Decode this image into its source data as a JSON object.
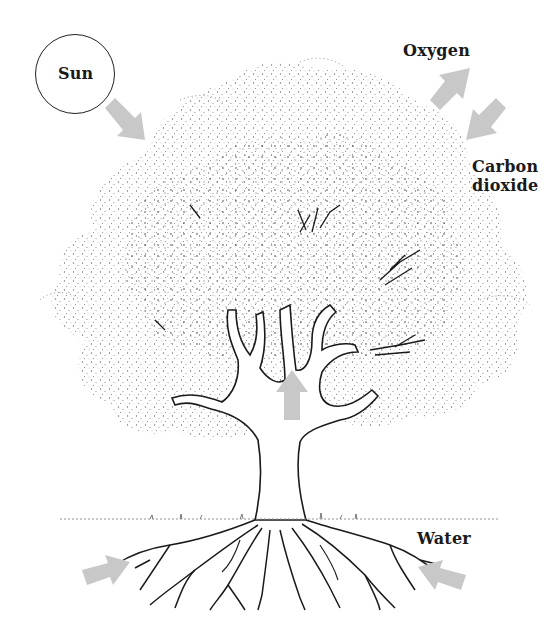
{
  "diagram": {
    "labels": {
      "sun": "Sun",
      "oxygen": "Oxygen",
      "carbon_dioxide_line1": "Carbon",
      "carbon_dioxide_line2": "dioxide",
      "water": "Water"
    },
    "arrows": [
      {
        "id": "sunlight",
        "direction": "down-right",
        "from": "Sun",
        "to": "canopy"
      },
      {
        "id": "oxygen-out",
        "direction": "up-right",
        "from": "canopy",
        "to": "Oxygen"
      },
      {
        "id": "co2-in",
        "direction": "down-left",
        "from": "Carbon dioxide",
        "to": "canopy"
      },
      {
        "id": "sap-up",
        "direction": "up",
        "from": "trunk",
        "to": "canopy"
      },
      {
        "id": "water-left",
        "direction": "right",
        "from": "soil",
        "to": "roots"
      },
      {
        "id": "water-right",
        "direction": "left",
        "from": "Water",
        "to": "roots"
      }
    ],
    "colors": {
      "arrow": "#c8c8c8",
      "ink": "#1a1a1a",
      "background": "#ffffff",
      "foliage": "#6a6a6a"
    }
  }
}
